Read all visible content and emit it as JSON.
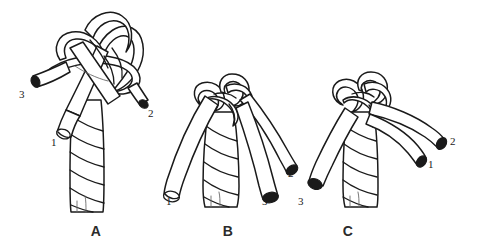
{
  "illustration": {
    "title": "Back splice / crown knot sequence",
    "background_color": "#ffffff",
    "ink_color": "#1a1a1a",
    "panel_count": 3
  },
  "panels": [
    {
      "id": "panel-a",
      "caption": "A",
      "caption_x": 96,
      "caption_y": 236,
      "description": "Crown knot loosely formed with three loops above the rope; strand ends 1, 2 and 3 project outward",
      "strand_labels": [
        {
          "text": "3",
          "x": 19,
          "y": 98
        },
        {
          "text": "1",
          "x": 51,
          "y": 146
        },
        {
          "text": "2",
          "x": 148,
          "y": 117
        }
      ]
    },
    {
      "id": "panel-b",
      "caption": "B",
      "caption_x": 228,
      "caption_y": 236,
      "description": "Crown knot drawn up snug at the rope end with the three strands splayed out; ends numbered 1, 2 and 3",
      "strand_labels": [
        {
          "text": "1",
          "x": 166,
          "y": 205
        },
        {
          "text": "2",
          "x": 288,
          "y": 177
        },
        {
          "text": "3",
          "x": 262,
          "y": 205
        }
      ]
    },
    {
      "id": "panel-c",
      "caption": "C",
      "caption_x": 348,
      "caption_y": 236,
      "description": "Finished crown with strand 3 led down to the left and strands 1 and 2 laid out to the right",
      "strand_labels": [
        {
          "text": "3",
          "x": 298,
          "y": 205
        },
        {
          "text": "2",
          "x": 450,
          "y": 145
        },
        {
          "text": "1",
          "x": 428,
          "y": 168
        }
      ]
    }
  ],
  "captions": {
    "a": "A",
    "b": "B",
    "c": "C"
  }
}
